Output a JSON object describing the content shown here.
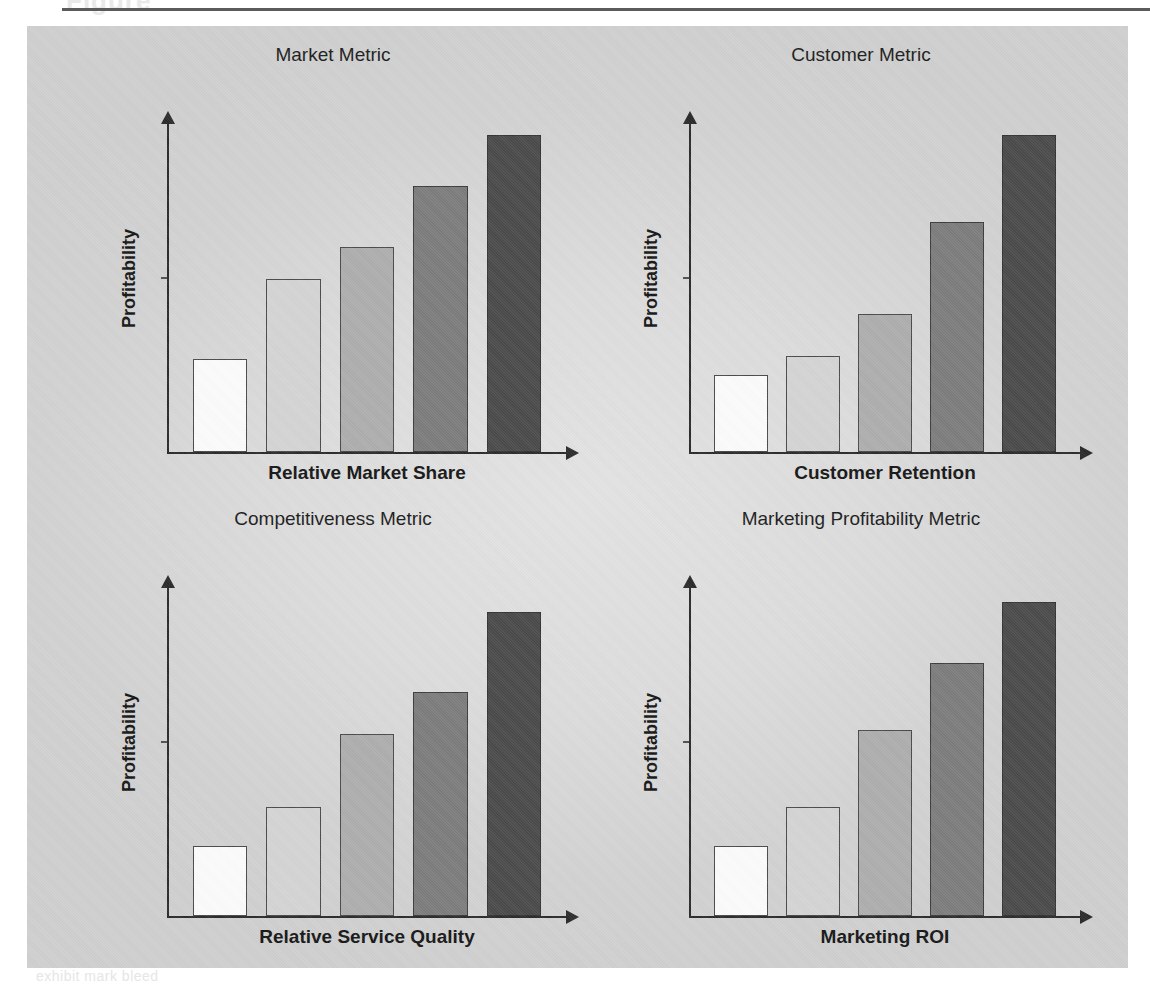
{
  "page": {
    "header_ghost": "Figure",
    "footer_ghost": "exhibit mark bleed"
  },
  "panel": {
    "background_color": "#dcdcdc",
    "border_color": "#cfcfcf"
  },
  "palette": {
    "bar_fills": [
      "#fbfbfb",
      "#d4d4d4",
      "#aeaeae",
      "#7d7d7d",
      "#4b4b4b"
    ],
    "bar_outline": "#4a4a4a",
    "axis_color": "#2b2b2b",
    "text_color": "#171717",
    "shadow_color": "rgba(60,60,60,0.30)"
  },
  "charts": [
    {
      "id": "market-metric",
      "title": "Market Metric",
      "ylabel": "Profitability",
      "xlabel": "Relative Market Share"
    },
    {
      "id": "customer-metric",
      "title": "Customer Metric",
      "ylabel": "Profitability",
      "xlabel": "Customer Retention"
    },
    {
      "id": "competitiveness-metric",
      "title": "Competitiveness Metric",
      "ylabel": "Profitability",
      "xlabel": "Relative Service Quality"
    },
    {
      "id": "marketing-profitability-metric",
      "title": "Marketing Profitability Metric",
      "ylabel": "Profitability",
      "xlabel": "Marketing ROI"
    }
  ],
  "chart_data": [
    {
      "type": "bar",
      "title": "Market Metric",
      "xlabel": "Relative Market Share",
      "ylabel": "Profitability",
      "categories": [
        "1",
        "2",
        "3",
        "4",
        "5"
      ],
      "values": [
        29,
        54,
        64,
        83,
        99
      ],
      "ylim": [
        0,
        100
      ],
      "grid": false,
      "legend": "none",
      "axis_ticks_labeled": false,
      "bar_fills": [
        "#fbfbfb",
        "#d4d4d4",
        "#aeaeae",
        "#7d7d7d",
        "#4b4b4b"
      ]
    },
    {
      "type": "bar",
      "title": "Customer Metric",
      "xlabel": "Customer Retention",
      "ylabel": "Profitability",
      "categories": [
        "1",
        "2",
        "3",
        "4",
        "5"
      ],
      "values": [
        24,
        30,
        43,
        72,
        99
      ],
      "ylim": [
        0,
        100
      ],
      "grid": false,
      "legend": "none",
      "axis_ticks_labeled": false,
      "bar_fills": [
        "#fbfbfb",
        "#d4d4d4",
        "#aeaeae",
        "#7d7d7d",
        "#4b4b4b"
      ]
    },
    {
      "type": "bar",
      "title": "Competitiveness Metric",
      "xlabel": "Relative Service Quality",
      "ylabel": "Profitability",
      "categories": [
        "1",
        "2",
        "3",
        "4",
        "5"
      ],
      "values": [
        22,
        34,
        57,
        70,
        95
      ],
      "ylim": [
        0,
        100
      ],
      "grid": false,
      "legend": "none",
      "axis_ticks_labeled": false,
      "bar_fills": [
        "#fbfbfb",
        "#d4d4d4",
        "#aeaeae",
        "#7d7d7d",
        "#4b4b4b"
      ]
    },
    {
      "type": "bar",
      "title": "Marketing Profitability Metric",
      "xlabel": "Marketing ROI",
      "ylabel": "Profitability",
      "categories": [
        "1",
        "2",
        "3",
        "4",
        "5"
      ],
      "values": [
        22,
        34,
        58,
        79,
        98
      ],
      "ylim": [
        0,
        100
      ],
      "grid": false,
      "legend": "none",
      "axis_ticks_labeled": false,
      "bar_fills": [
        "#fbfbfb",
        "#d4d4d4",
        "#aeaeae",
        "#7d7d7d",
        "#4b4b4b"
      ]
    }
  ]
}
